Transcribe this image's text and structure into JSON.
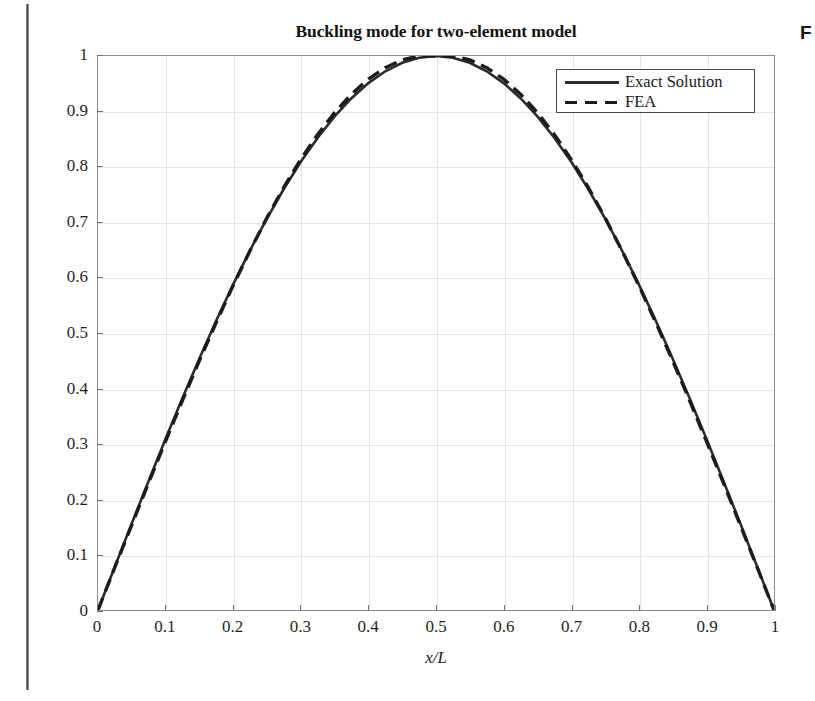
{
  "scan": {
    "caption_fragment": "F"
  },
  "chart_data": {
    "type": "line",
    "title": "Buckling mode for two-element model",
    "xlabel": "x/L",
    "ylabel": "",
    "xlim": [
      0,
      1
    ],
    "ylim": [
      0,
      1
    ],
    "grid": true,
    "legend_position": "upper right",
    "xticklabels": [
      "0",
      "0.1",
      "0.2",
      "0.3",
      "0.4",
      "0.5",
      "0.6",
      "0.7",
      "0.8",
      "0.9",
      "1"
    ],
    "xticks": [
      0,
      0.1,
      0.2,
      0.3,
      0.4,
      0.5,
      0.6,
      0.7,
      0.8,
      0.9,
      1
    ],
    "yticklabels": [
      "0",
      "0.1",
      "0.2",
      "0.3",
      "0.4",
      "0.5",
      "0.6",
      "0.7",
      "0.8",
      "0.9",
      "1"
    ],
    "yticks": [
      0,
      0.1,
      0.2,
      0.3,
      0.4,
      0.5,
      0.6,
      0.7,
      0.8,
      0.9,
      1
    ],
    "series": [
      {
        "name": "Exact Solution",
        "style": "solid",
        "color": "#2b2b2b",
        "x": [
          0,
          0.025,
          0.05,
          0.075,
          0.1,
          0.125,
          0.15,
          0.175,
          0.2,
          0.225,
          0.25,
          0.275,
          0.3,
          0.325,
          0.35,
          0.375,
          0.4,
          0.425,
          0.45,
          0.475,
          0.5,
          0.525,
          0.55,
          0.575,
          0.6,
          0.625,
          0.65,
          0.675,
          0.7,
          0.725,
          0.75,
          0.775,
          0.8,
          0.825,
          0.85,
          0.875,
          0.9,
          0.925,
          0.95,
          0.975,
          1
        ],
        "y": [
          0,
          0.0785,
          0.1564,
          0.2334,
          0.309,
          0.3827,
          0.454,
          0.5225,
          0.5878,
          0.6494,
          0.7071,
          0.7604,
          0.809,
          0.8526,
          0.891,
          0.9239,
          0.9511,
          0.9724,
          0.9877,
          0.9969,
          1.0,
          0.9969,
          0.9877,
          0.9724,
          0.9511,
          0.9239,
          0.891,
          0.8526,
          0.809,
          0.7604,
          0.7071,
          0.6494,
          0.5878,
          0.5225,
          0.454,
          0.3827,
          0.309,
          0.2334,
          0.1564,
          0.0785,
          0
        ]
      },
      {
        "name": "FEA",
        "style": "dashed",
        "color": "#1c1c1c",
        "x": [
          0,
          0.025,
          0.05,
          0.075,
          0.1,
          0.125,
          0.15,
          0.175,
          0.2,
          0.225,
          0.25,
          0.275,
          0.3,
          0.325,
          0.35,
          0.375,
          0.4,
          0.425,
          0.45,
          0.475,
          0.5,
          0.525,
          0.55,
          0.575,
          0.6,
          0.625,
          0.65,
          0.675,
          0.7,
          0.725,
          0.75,
          0.775,
          0.8,
          0.825,
          0.85,
          0.875,
          0.9,
          0.925,
          0.95,
          0.975,
          1
        ],
        "y": [
          0,
          0.0772,
          0.1538,
          0.2299,
          0.3048,
          0.3784,
          0.4501,
          0.5194,
          0.5859,
          0.649,
          0.7083,
          0.7633,
          0.8135,
          0.8585,
          0.8978,
          0.9312,
          0.9583,
          0.979,
          0.993,
          1.0,
          1.0,
          1.0,
          0.993,
          0.979,
          0.9583,
          0.9312,
          0.8978,
          0.8585,
          0.8135,
          0.7633,
          0.7083,
          0.649,
          0.5859,
          0.5194,
          0.4501,
          0.3784,
          0.3048,
          0.2299,
          0.1538,
          0.0772,
          0
        ]
      }
    ]
  }
}
